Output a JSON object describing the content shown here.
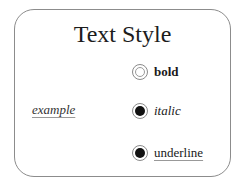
{
  "dialog": {
    "title": "Text Style",
    "preview_text": "example",
    "options": [
      {
        "label": "bold",
        "selected": false
      },
      {
        "label": "italic",
        "selected": true
      },
      {
        "label": "underline",
        "selected": true
      }
    ]
  }
}
